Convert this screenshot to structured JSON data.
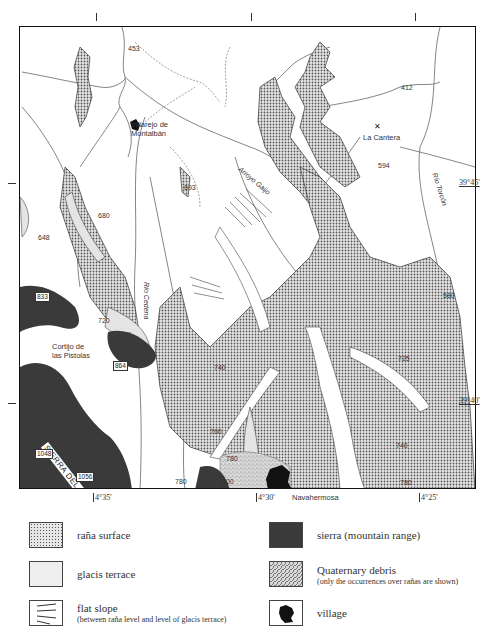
{
  "map": {
    "places": [
      {
        "id": "villarejo",
        "label_line1": "Villarejo de",
        "label_line2": "Montalbán"
      },
      {
        "id": "la_cantera",
        "label": "La Cantera"
      },
      {
        "id": "cortijo",
        "label_line1": "Cortijo de",
        "label_line2": "las Pistolas"
      },
      {
        "id": "navahermosa",
        "label": "Navahermosa"
      }
    ],
    "rivers": {
      "arroyo_gaijo": "Arroyo Gaijo",
      "rio_cedena": "Río Cedena",
      "rio_torcon": "Río Torcón"
    },
    "sierra_label": "SIERRA DEL ACEBAL",
    "elevations": {
      "e453": "453",
      "e412": "412",
      "e594": "594",
      "e693": "693",
      "e680": "680",
      "e648": "648",
      "e580": "580",
      "e620": "620",
      "e720": "720",
      "e740": "740",
      "e725": "725",
      "e760": "760",
      "e780a": "780",
      "e780b": "780",
      "e780c": "780",
      "e800": "800",
      "e740b": "740"
    },
    "boxed_elevations": {
      "b833": "833",
      "b864": "864",
      "b1048": "1048",
      "b1056": "1056"
    },
    "coordinates": {
      "lat_45": "39°45'",
      "lat_40": "39°40'",
      "lon_35": "4°35'",
      "lon_30": "4°30'",
      "lon_25": "4°25'"
    }
  },
  "legend": [
    {
      "id": "rana",
      "label": "raña surface",
      "sub": ""
    },
    {
      "id": "sierra",
      "label": "sierra (mountain range)",
      "sub": ""
    },
    {
      "id": "glacis",
      "label": "glacis terrace",
      "sub": ""
    },
    {
      "id": "debris",
      "label": "Quaternary debris",
      "sub": "(only the occurrences over rañas are shown)"
    },
    {
      "id": "flat",
      "label": "flat slope",
      "sub": "(between raña level and level of glacis terrace)"
    },
    {
      "id": "village",
      "label": "village",
      "sub": ""
    }
  ],
  "colors": {
    "sierra": "#3a3a3a",
    "rana_fill": "#bdbdbd",
    "glacis_fill": "#dcdcdc",
    "line": "#555555"
  }
}
